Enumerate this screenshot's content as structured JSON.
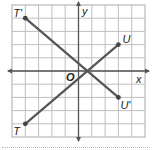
{
  "diagram": {
    "type": "coordinate-plane",
    "grid": {
      "columns": 10,
      "rows": 10,
      "x_range": [
        -5,
        5
      ],
      "y_range": [
        -5,
        5
      ]
    },
    "axes": {
      "x_label": "x",
      "y_label": "y",
      "origin_label": "O"
    },
    "points": [
      {
        "label": "T'",
        "x": -4,
        "y": 4
      },
      {
        "label": "U",
        "x": 3,
        "y": 2
      },
      {
        "label": "U'",
        "x": 3,
        "y": -2
      },
      {
        "label": "T",
        "x": -4,
        "y": -4
      }
    ],
    "segments": [
      {
        "name": "TU",
        "from": "T",
        "to": "U"
      },
      {
        "name": "T'U'",
        "from": "T'",
        "to": "U'"
      }
    ],
    "colors": {
      "grid": "#bfbfbf",
      "axis": "#555555",
      "segment": "#555555",
      "border": "#aaaaaa"
    }
  }
}
